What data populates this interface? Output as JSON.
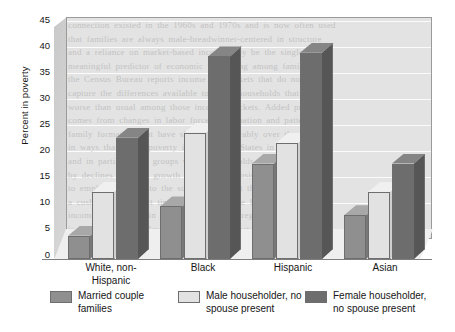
{
  "chart_data": {
    "type": "bar",
    "title": "",
    "subtitle": "",
    "xlabel": "",
    "ylabel": "Percent in poverty",
    "ylim": [
      0,
      45
    ],
    "ytick_step": 5,
    "yticks": [
      "0",
      "5",
      "10",
      "15",
      "20",
      "25",
      "30",
      "35",
      "40",
      "45"
    ],
    "grid": true,
    "style": "3d-bar",
    "legend_position": "bottom",
    "categories": [
      "White, non-Hispanic",
      "Black",
      "Hispanic",
      "Asian"
    ],
    "series": [
      {
        "name": "Married couple families",
        "label_line1": "Married couple",
        "label_line2": "families",
        "color": "#8f8f8f",
        "side_color": "#787878",
        "top_color": "#a8a8a8",
        "values": [
          4.5,
          10.2,
          18.5,
          8.5
        ]
      },
      {
        "name": "Male householder, no spouse present",
        "label_line1": "Male householder, no",
        "label_line2": "spouse present",
        "color": "#e2e2e2",
        "side_color": "#cfcfcf",
        "top_color": "#f0f0f0",
        "values": [
          13.0,
          24.5,
          22.5,
          13.0
        ]
      },
      {
        "name": "Female householder, no spouse present",
        "label_line1": "Female householder,",
        "label_line2": "no spouse present",
        "color": "#6d6d6d",
        "side_color": "#565656",
        "top_color": "#858585",
        "values": [
          23.5,
          39.3,
          40.0,
          18.5
        ]
      }
    ]
  },
  "axis": {
    "ylabel": "Percent in poverty"
  },
  "category_labels": [
    {
      "line1": "White, non-",
      "line2": "Hispanic"
    },
    {
      "line1": "Black",
      "line2": ""
    },
    {
      "line1": "Hispanic",
      "line2": ""
    },
    {
      "line1": "Asian",
      "line2": ""
    }
  ],
  "legend": {
    "items": [
      {
        "label": "Married couple\nfamilies",
        "color": "#8f8f8f"
      },
      {
        "label": "Male householder, no\nspouse present",
        "color": "#e2e2e2"
      },
      {
        "label": "Female householder,\nno spouse present",
        "color": "#6d6d6d"
      }
    ]
  },
  "background_text": {
    "lines": [
      "connection existed in the 1960s and 1970s and is now often used",
      "that families are always male-breadwinner-centered in structure",
      "and a reliance on market-based income may be the single most",
      "meaningful predictor of economic well-being among families",
      "the Census Bureau reports income in brackets that do not always",
      "capture the differences available to those households that fare",
      "worse than usual among those income brackets. Added pressure",
      "comes from changes in labor force participation and patterns of",
      "family formation that have shifted considerably over the decades",
      "in ways that affect poverty in the United States in recent years",
      "and in particular on groups whose households are most affected",
      "by declines in wage growth and by the erosion of benefits tied",
      "to employment and to the social safety net that once provided",
      "a cushion in difficult times for those at the lower end of the",
      "income distribution in the country and its regional economies",
      "is significantly smaller relative to that reported in earlier work",
      "and there is substantial variation within each of these groups",
      "that the aggregate figures reported here cannot fully capture"
    ]
  }
}
